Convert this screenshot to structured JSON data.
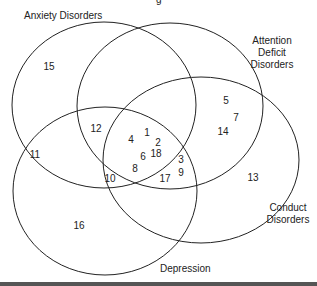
{
  "title_fragment": "g",
  "sets": [
    {
      "name": "Anxiety Disorders",
      "lines": [
        "Anxiety Disorders"
      ],
      "cx": 104,
      "cy": 105,
      "rx": 92,
      "ry": 83,
      "label_x": 24,
      "label_y": 19,
      "anchor": "start"
    },
    {
      "name": "Attention Deficit Disorders",
      "lines": [
        "Attention",
        "Deficit",
        "Disorders"
      ],
      "cx": 170,
      "cy": 106,
      "rx": 93,
      "ry": 83,
      "label_x": 272,
      "label_y": 44,
      "anchor": "middle"
    },
    {
      "name": "Conduct Disorders",
      "lines": [
        "Conduct",
        "Disorders"
      ],
      "cx": 201,
      "cy": 160,
      "rx": 98,
      "ry": 83,
      "label_x": 288,
      "label_y": 211,
      "anchor": "middle"
    },
    {
      "name": "Depression",
      "lines": [
        "Depression"
      ],
      "cx": 105,
      "cy": 191,
      "rx": 92,
      "ry": 84,
      "label_x": 160,
      "label_y": 272,
      "anchor": "start"
    }
  ],
  "items": [
    {
      "id": "1",
      "x": 147,
      "y": 136
    },
    {
      "id": "2",
      "x": 158,
      "y": 146
    },
    {
      "id": "3",
      "x": 181,
      "y": 163
    },
    {
      "id": "4",
      "x": 131,
      "y": 143
    },
    {
      "id": "5",
      "x": 226,
      "y": 104
    },
    {
      "id": "6",
      "x": 143,
      "y": 160
    },
    {
      "id": "7",
      "x": 236,
      "y": 121
    },
    {
      "id": "8",
      "x": 135,
      "y": 172
    },
    {
      "id": "9",
      "x": 181,
      "y": 176
    },
    {
      "id": "10",
      "x": 110,
      "y": 182
    },
    {
      "id": "11",
      "x": 35,
      "y": 158
    },
    {
      "id": "12",
      "x": 96,
      "y": 132
    },
    {
      "id": "13",
      "x": 253,
      "y": 181
    },
    {
      "id": "14",
      "x": 223,
      "y": 135
    },
    {
      "id": "15",
      "x": 49,
      "y": 70
    },
    {
      "id": "16",
      "x": 79,
      "y": 229
    },
    {
      "id": "17",
      "x": 165,
      "y": 182
    },
    {
      "id": "18",
      "x": 156,
      "y": 157
    }
  ],
  "colors": {
    "stroke": "#222222",
    "text": "#222222",
    "bottom_bar": "#555555"
  }
}
